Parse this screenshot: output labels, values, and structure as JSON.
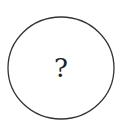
{
  "diagram": {
    "node": {
      "shape": "circle",
      "label": "?",
      "center": [
        61,
        68
      ],
      "radius_x": 53,
      "radius_y": 51,
      "stroke": "#333333",
      "fill": "#ffffff"
    }
  }
}
